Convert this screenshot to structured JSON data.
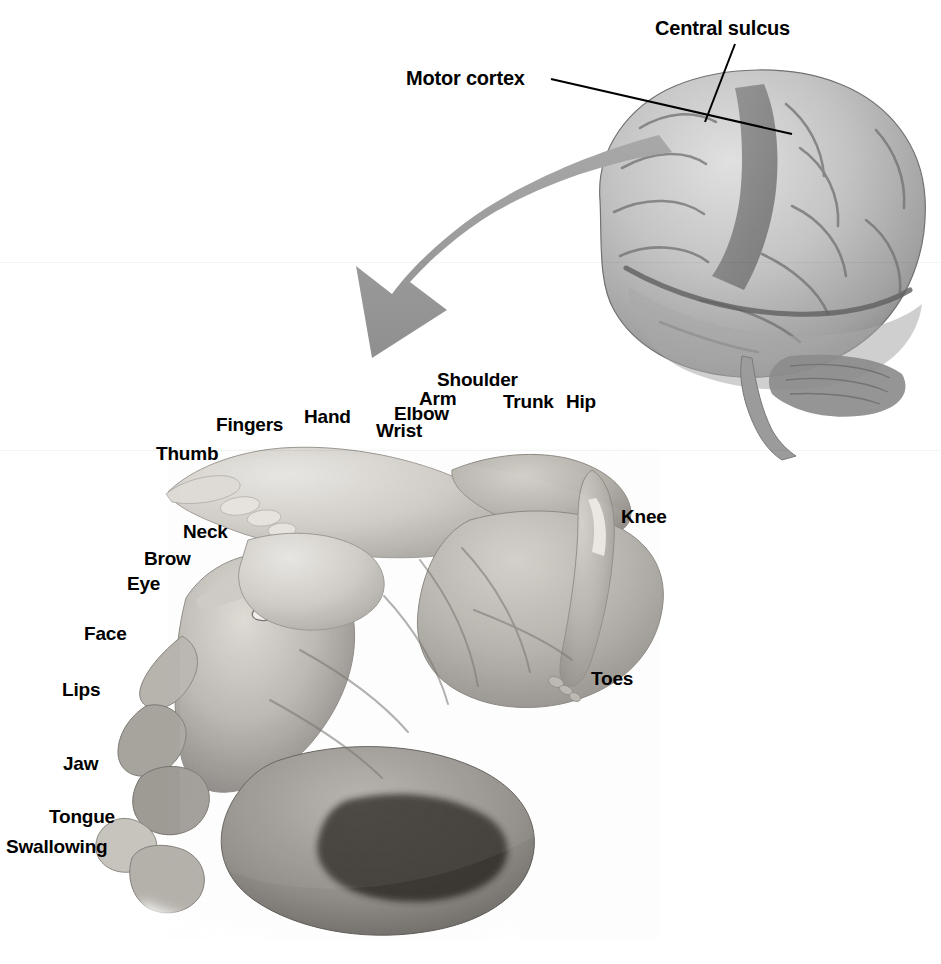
{
  "figure": {
    "background_color": "#ffffff",
    "text_color": "#000000",
    "arrow_color": "#9a9a9a",
    "leader_line_color": "#000000",
    "width": 941,
    "height": 964
  },
  "brain_labels": [
    {
      "id": "central-sulcus",
      "text": "Central sulcus",
      "x": 655,
      "y": 18
    },
    {
      "id": "motor-cortex",
      "text": "Motor cortex",
      "x": 406,
      "y": 68
    }
  ],
  "homunculus_labels_top": [
    {
      "id": "shoulder",
      "text": "Shoulder",
      "x": 437,
      "y": 370
    },
    {
      "id": "arm",
      "text": "Arm",
      "x": 419,
      "y": 389
    },
    {
      "id": "trunk",
      "text": "Trunk",
      "x": 503,
      "y": 392
    },
    {
      "id": "hip",
      "text": "Hip",
      "x": 566,
      "y": 392
    },
    {
      "id": "elbow",
      "text": "Elbow",
      "x": 394,
      "y": 404
    },
    {
      "id": "hand",
      "text": "Hand",
      "x": 304,
      "y": 407
    },
    {
      "id": "fingers",
      "text": "Fingers",
      "x": 216,
      "y": 415
    },
    {
      "id": "wrist",
      "text": "Wrist",
      "x": 376,
      "y": 421
    },
    {
      "id": "thumb",
      "text": "Thumb",
      "x": 156,
      "y": 444
    }
  ],
  "homunculus_labels_left": [
    {
      "id": "neck",
      "text": "Neck",
      "x": 183,
      "y": 522
    },
    {
      "id": "brow",
      "text": "Brow",
      "x": 144,
      "y": 549
    },
    {
      "id": "eye",
      "text": "Eye",
      "x": 127,
      "y": 574
    },
    {
      "id": "face",
      "text": "Face",
      "x": 84,
      "y": 624
    },
    {
      "id": "lips",
      "text": "Lips",
      "x": 62,
      "y": 680
    },
    {
      "id": "jaw",
      "text": "Jaw",
      "x": 63,
      "y": 754
    },
    {
      "id": "tongue",
      "text": "Tongue",
      "x": 49,
      "y": 807
    },
    {
      "id": "swallowing",
      "text": "Swallowing",
      "x": 6,
      "y": 837
    }
  ],
  "homunculus_labels_right": [
    {
      "id": "knee",
      "text": "Knee",
      "x": 621,
      "y": 507
    },
    {
      "id": "toes",
      "text": "Toes",
      "x": 591,
      "y": 669
    }
  ],
  "graphics": {
    "brain_name": "lateral-view-human-brain",
    "homunculus_name": "motor-homunculus-figure",
    "arrow_name": "magnify-arrow",
    "leader_central_sulcus": "line from Central sulcus label down-left to central sulcus on brain",
    "leader_motor_cortex": "line from Motor cortex label right-down to precentral gyrus"
  }
}
